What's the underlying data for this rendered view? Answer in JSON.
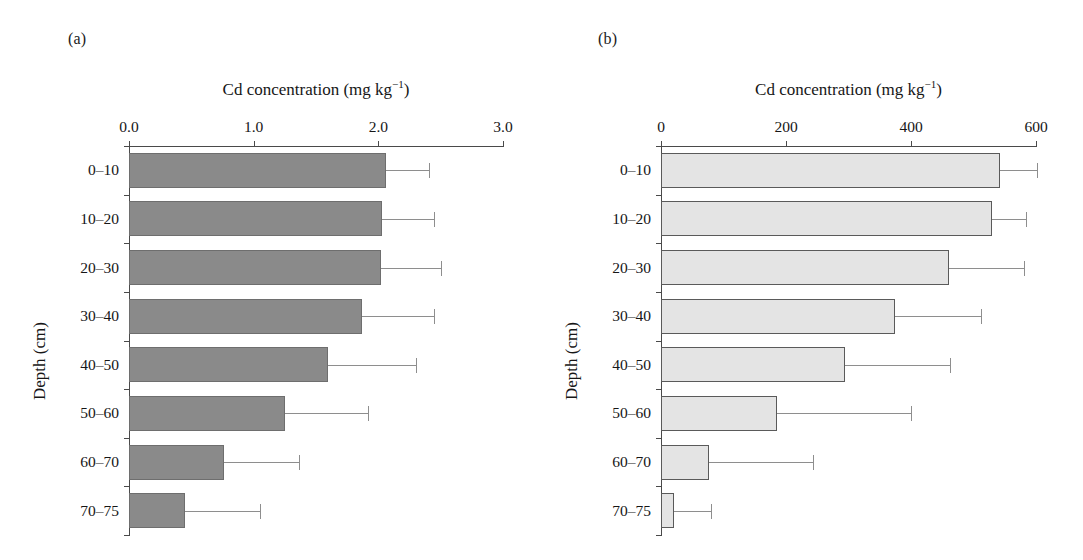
{
  "figure": {
    "panels": [
      {
        "letter": "(a)",
        "xlabel_main": "Cd concentration (mg kg",
        "xlabel_sup": "−1",
        "xlabel_tail": ")",
        "ylabel": "Depth (cm)",
        "xticks": [
          "0.0",
          "1.0",
          "2.0",
          "3.0"
        ],
        "ycats": [
          "0–10",
          "10–20",
          "20–30",
          "30–40",
          "40–50",
          "50–60",
          "60–70",
          "70–75"
        ],
        "bar_fill": "#8a8a8a",
        "bar_stroke": "#6e6e6e"
      },
      {
        "letter": "(b)",
        "xlabel_main": "Cd concentration (mg kg",
        "xlabel_sup": "−1",
        "xlabel_tail": ")",
        "ylabel": "Depth (cm)",
        "xticks": [
          "0",
          "200",
          "400",
          "600"
        ],
        "ycats": [
          "0–10",
          "10–20",
          "20–30",
          "30–40",
          "40–50",
          "50–60",
          "60–70",
          "70–75"
        ],
        "bar_fill": "#e4e4e4",
        "bar_stroke": "#5a5a5a"
      }
    ]
  },
  "chart_data": [
    {
      "type": "bar",
      "orientation": "horizontal",
      "panel": "(a)",
      "title": "",
      "xlabel": "Cd concentration (mg kg−1)",
      "ylabel": "Depth (cm)",
      "categories": [
        "0–10",
        "10–20",
        "20–30",
        "30–40",
        "40–50",
        "50–60",
        "60–70",
        "70–75"
      ],
      "values": [
        2.06,
        2.03,
        2.02,
        1.87,
        1.6,
        1.25,
        0.76,
        0.45
      ],
      "error_upper": [
        2.41,
        2.45,
        2.5,
        2.45,
        2.3,
        1.92,
        1.36,
        1.05
      ],
      "error_bars": [
        0.35,
        0.42,
        0.48,
        0.58,
        0.7,
        0.67,
        0.6,
        0.6
      ],
      "xlim": [
        0.0,
        3.0
      ],
      "xticks": [
        0.0,
        1.0,
        2.0,
        3.0
      ],
      "grid": false,
      "legend": null
    },
    {
      "type": "bar",
      "orientation": "horizontal",
      "panel": "(b)",
      "title": "",
      "xlabel": "Cd concentration (mg kg−1)",
      "ylabel": "Depth (cm)",
      "categories": [
        "0–10",
        "10–20",
        "20–30",
        "30–40",
        "40–50",
        "50–60",
        "60–70",
        "70–75"
      ],
      "values": [
        542,
        530,
        460,
        375,
        295,
        185,
        77,
        21
      ],
      "error_upper": [
        601,
        584,
        580,
        512,
        462,
        400,
        243,
        80
      ],
      "error_bars": [
        59,
        54,
        120,
        137,
        167,
        215,
        166,
        59
      ],
      "xlim": [
        0,
        600
      ],
      "xticks": [
        0,
        200,
        400,
        600
      ],
      "grid": false,
      "legend": null
    }
  ]
}
